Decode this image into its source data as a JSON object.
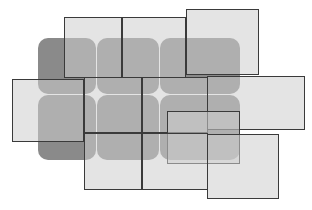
{
  "diagram": {
    "title": "",
    "background": "#ffffff",
    "tile_color": "#8a8a8a",
    "frame_fill": "rgba(205,205,205,0.55)",
    "frame_border": "#3a3a3a",
    "tiles": [
      {
        "x": 38,
        "y": 38,
        "w": 58,
        "h": 56
      },
      {
        "x": 97,
        "y": 38,
        "w": 62,
        "h": 56
      },
      {
        "x": 160,
        "y": 38,
        "w": 80,
        "h": 56
      },
      {
        "x": 38,
        "y": 95,
        "w": 58,
        "h": 65
      },
      {
        "x": 97,
        "y": 95,
        "w": 62,
        "h": 65
      },
      {
        "x": 160,
        "y": 95,
        "w": 80,
        "h": 65
      }
    ],
    "frames": [
      {
        "x": 64,
        "y": 17,
        "w": 58,
        "h": 61
      },
      {
        "x": 122,
        "y": 17,
        "w": 64,
        "h": 61
      },
      {
        "x": 186,
        "y": 9,
        "w": 73,
        "h": 66
      },
      {
        "x": 12,
        "y": 79,
        "w": 72,
        "h": 63
      },
      {
        "x": 84,
        "y": 77,
        "w": 58,
        "h": 56
      },
      {
        "x": 142,
        "y": 77,
        "w": 66,
        "h": 56
      },
      {
        "x": 207,
        "y": 76,
        "w": 98,
        "h": 54
      },
      {
        "x": 167,
        "y": 111,
        "w": 73,
        "h": 53
      },
      {
        "x": 84,
        "y": 133,
        "w": 58,
        "h": 57
      },
      {
        "x": 142,
        "y": 133,
        "w": 66,
        "h": 57
      },
      {
        "x": 207,
        "y": 134,
        "w": 72,
        "h": 65
      }
    ]
  }
}
